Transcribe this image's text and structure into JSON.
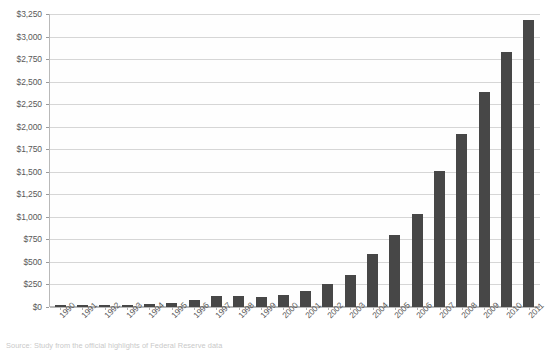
{
  "chart_data": {
    "type": "bar",
    "title": "",
    "xlabel": "",
    "ylabel": "",
    "ylim": [
      0,
      3250
    ],
    "grid": true,
    "legend": null,
    "bar_color": "#474747",
    "categories": [
      "1990",
      "1991",
      "1992",
      "1993",
      "1994",
      "1995",
      "1996",
      "1997",
      "1998",
      "1999",
      "2000",
      "2001",
      "2002",
      "2003",
      "2004",
      "2005",
      "2006",
      "2007",
      "2008",
      "2009",
      "2010",
      "2011"
    ],
    "values": [
      18,
      25,
      10,
      10,
      30,
      48,
      75,
      120,
      118,
      115,
      135,
      175,
      250,
      360,
      590,
      795,
      1030,
      1510,
      1920,
      2390,
      2825,
      3180
    ],
    "ytick_labels": [
      "$3,250",
      "$3,000",
      "$2,750",
      "$2,500",
      "$2,250",
      "$2,000",
      "$1,750",
      "$1,500",
      "$1,250",
      "$1,000",
      "$750",
      "$500",
      "$250",
      "$0"
    ],
    "ytick_values": [
      3250,
      3000,
      2750,
      2500,
      2250,
      2000,
      1750,
      1500,
      1250,
      1000,
      750,
      500,
      250,
      0
    ]
  },
  "caption": {
    "text": "Source: Study from the official highlights of Federal Reserve data"
  }
}
